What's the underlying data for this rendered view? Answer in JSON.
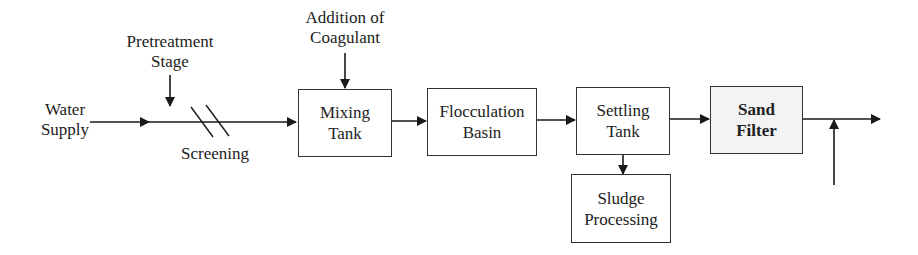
{
  "diagram": {
    "inputs": {
      "water_supply": {
        "line1": "Water",
        "line2": "Supply"
      },
      "pretreatment": {
        "line1": "Pretreatment",
        "line2": "Stage"
      },
      "screening": "Screening",
      "coagulant": {
        "line1": "Addition of",
        "line2": "Coagulant"
      }
    },
    "boxes": [
      {
        "id": "mixing",
        "line1": "Mixing",
        "line2": "Tank"
      },
      {
        "id": "flocculation",
        "line1": "Flocculation",
        "line2": "Basin"
      },
      {
        "id": "settling",
        "line1": "Settling",
        "line2": "Tank"
      },
      {
        "id": "sand_filter",
        "line1": "Sand",
        "line2": "Filter",
        "shaded": true
      },
      {
        "id": "sludge",
        "line1": "Sludge",
        "line2": "Processing"
      }
    ],
    "colors": {
      "stroke": "#1a1a1a",
      "box_fill": "#ffffff",
      "shaded_fill": "#f3f3f3"
    }
  }
}
